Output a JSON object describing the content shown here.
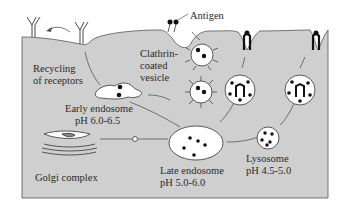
{
  "diagram": {
    "background_color": "#cfcfcf",
    "labels": {
      "antigen": "Antigen",
      "clathrin_line1": "Clathrin-",
      "clathrin_line2": "coated",
      "clathrin_line3": "vesicle",
      "recycling_line1": "Recycling",
      "recycling_line2": "of receptors",
      "early_endosome": "Early endosome",
      "early_ph": "pH 6.0-6.5",
      "golgi": "Golgi complex",
      "late_endosome": "Late endosome",
      "late_ph": "pH 5.0-6.0",
      "lysosome": "Lysosome",
      "lysosome_ph": "pH 4.5-5.0"
    },
    "nodes": [
      "Antigen",
      "Clathrin-coated vesicle",
      "Early endosome",
      "Golgi complex",
      "Late endosome",
      "Lysosome",
      "Receptor recycling"
    ],
    "edges": [
      [
        "Antigen",
        "Clathrin-coated vesicle"
      ],
      [
        "Clathrin-coated vesicle",
        "Early endosome"
      ],
      [
        "Early endosome",
        "Recycling of receptors"
      ],
      [
        "Early endosome",
        "Late endosome"
      ],
      [
        "Golgi complex",
        "Late endosome"
      ],
      [
        "Late endosome",
        "Lysosome"
      ],
      [
        "Late endosome",
        "Membrane presentation"
      ],
      [
        "Lysosome",
        "Membrane presentation"
      ]
    ]
  }
}
